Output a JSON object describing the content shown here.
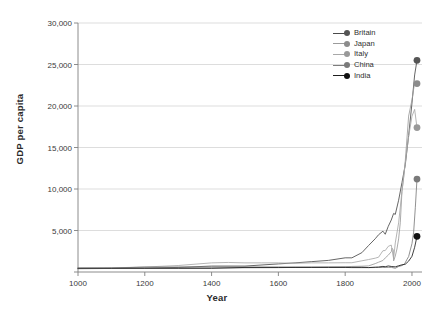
{
  "chart_data": {
    "type": "line",
    "title": "",
    "xlabel": "Year",
    "ylabel": "GDP per capita",
    "xlim": [
      1000,
      2030
    ],
    "ylim": [
      0,
      30000
    ],
    "xticks": [
      1000,
      1200,
      1400,
      1600,
      1800,
      2000
    ],
    "xtick_labels": [
      "1000",
      "1200",
      "1400",
      "1600",
      "1800",
      "2000"
    ],
    "yticks": [
      0,
      5000,
      10000,
      15000,
      20000,
      25000,
      30000
    ],
    "ytick_labels": [
      "0",
      "5,000",
      "10,000",
      "15,000",
      "20,000",
      "25,000",
      "30,000"
    ],
    "grid": "horizontal",
    "legend_position": "top-right",
    "series": [
      {
        "name": "Britain",
        "color": "#4a4a4a",
        "marker_color": "#555555",
        "endpoint_value": 25500,
        "endpoint_year": 2015,
        "x": [
          1000,
          1100,
          1200,
          1300,
          1400,
          1500,
          1600,
          1650,
          1700,
          1750,
          1800,
          1820,
          1850,
          1870,
          1890,
          1900,
          1913,
          1920,
          1929,
          1938,
          1945,
          1950,
          1960,
          1970,
          1980,
          1990,
          2000,
          2008,
          2015
        ],
        "values": [
          400,
          427,
          465,
          551,
          714,
          714,
          974,
          1100,
          1250,
          1400,
          1706,
          1706,
          2330,
          3190,
          4009,
          4492,
          4921,
          4548,
          5503,
          6266,
          7056,
          6939,
          8645,
          10767,
          12931,
          16430,
          20353,
          23742,
          25500
        ]
      },
      {
        "name": "Japan",
        "color": "#9b9b9b",
        "marker_color": "#8c8c8c",
        "endpoint_value": 22700,
        "endpoint_year": 2015,
        "x": [
          1000,
          1100,
          1200,
          1300,
          1400,
          1500,
          1600,
          1650,
          1700,
          1750,
          1800,
          1820,
          1850,
          1870,
          1890,
          1900,
          1913,
          1920,
          1929,
          1938,
          1940,
          1944,
          1945,
          1946,
          1950,
          1955,
          1960,
          1965,
          1970,
          1975,
          1980,
          1990,
          2000,
          2008,
          2015
        ],
        "values": [
          425,
          425,
          430,
          440,
          450,
          500,
          520,
          560,
          570,
          600,
          620,
          669,
          700,
          737,
          1012,
          1180,
          1387,
          1696,
          2026,
          2449,
          2874,
          2659,
          1346,
          1444,
          1921,
          2771,
          3986,
          5934,
          9714,
          11344,
          13428,
          18789,
          20738,
          22816,
          22700
        ]
      },
      {
        "name": "Italy",
        "color": "#a8a8a8",
        "marker_color": "#999999",
        "endpoint_value": 17400,
        "endpoint_year": 2015,
        "x": [
          1000,
          1100,
          1200,
          1300,
          1400,
          1450,
          1500,
          1550,
          1600,
          1650,
          1700,
          1750,
          1800,
          1820,
          1850,
          1870,
          1890,
          1900,
          1913,
          1920,
          1929,
          1938,
          1945,
          1950,
          1960,
          1970,
          1980,
          1990,
          2000,
          2008,
          2015
        ],
        "values": [
          450,
          500,
          600,
          780,
          1100,
          1150,
          1100,
          1100,
          1100,
          1050,
          1100,
          1100,
          1117,
          1117,
          1350,
          1499,
          1667,
          1785,
          2564,
          2587,
          3093,
          3244,
          1596,
          3502,
          5916,
          9719,
          13149,
          16313,
          18770,
          19594,
          17400
        ]
      },
      {
        "name": "China",
        "color": "#7d7d7d",
        "marker_color": "#7a7a7a",
        "endpoint_value": 11200,
        "endpoint_year": 2015,
        "x": [
          1000,
          1100,
          1200,
          1300,
          1400,
          1500,
          1600,
          1650,
          1700,
          1750,
          1800,
          1820,
          1850,
          1870,
          1890,
          1900,
          1913,
          1920,
          1929,
          1938,
          1950,
          1960,
          1970,
          1978,
          1985,
          1990,
          1995,
          2000,
          2005,
          2010,
          2015
        ],
        "values": [
          466,
          466,
          600,
          600,
          600,
          600,
          600,
          600,
          600,
          600,
          600,
          600,
          600,
          530,
          540,
          545,
          552,
          552,
          562,
          562,
          448,
          662,
          778,
          978,
          1522,
          1858,
          2653,
          3421,
          4803,
          7746,
          11200
        ]
      },
      {
        "name": "India",
        "color": "#1e1e1e",
        "marker_color": "#111111",
        "endpoint_value": 4300,
        "endpoint_year": 2015,
        "x": [
          1000,
          1100,
          1200,
          1300,
          1400,
          1500,
          1600,
          1650,
          1700,
          1750,
          1800,
          1820,
          1850,
          1870,
          1890,
          1900,
          1913,
          1920,
          1929,
          1938,
          1950,
          1960,
          1970,
          1980,
          1990,
          2000,
          2008,
          2015
        ],
        "values": [
          450,
          450,
          450,
          450,
          450,
          550,
          550,
          550,
          550,
          550,
          550,
          533,
          533,
          533,
          584,
          599,
          673,
          635,
          728,
          668,
          619,
          753,
          868,
          938,
          1309,
          1892,
          2975,
          4300
        ]
      }
    ]
  },
  "legend": {
    "items": [
      {
        "label": "Britain"
      },
      {
        "label": "Japan"
      },
      {
        "label": "Italy"
      },
      {
        "label": "China"
      },
      {
        "label": "India"
      }
    ]
  },
  "colors": {
    "background": "#ffffff",
    "gridline": "#cfcfcf",
    "axis": "#808080",
    "text": "#333333"
  }
}
